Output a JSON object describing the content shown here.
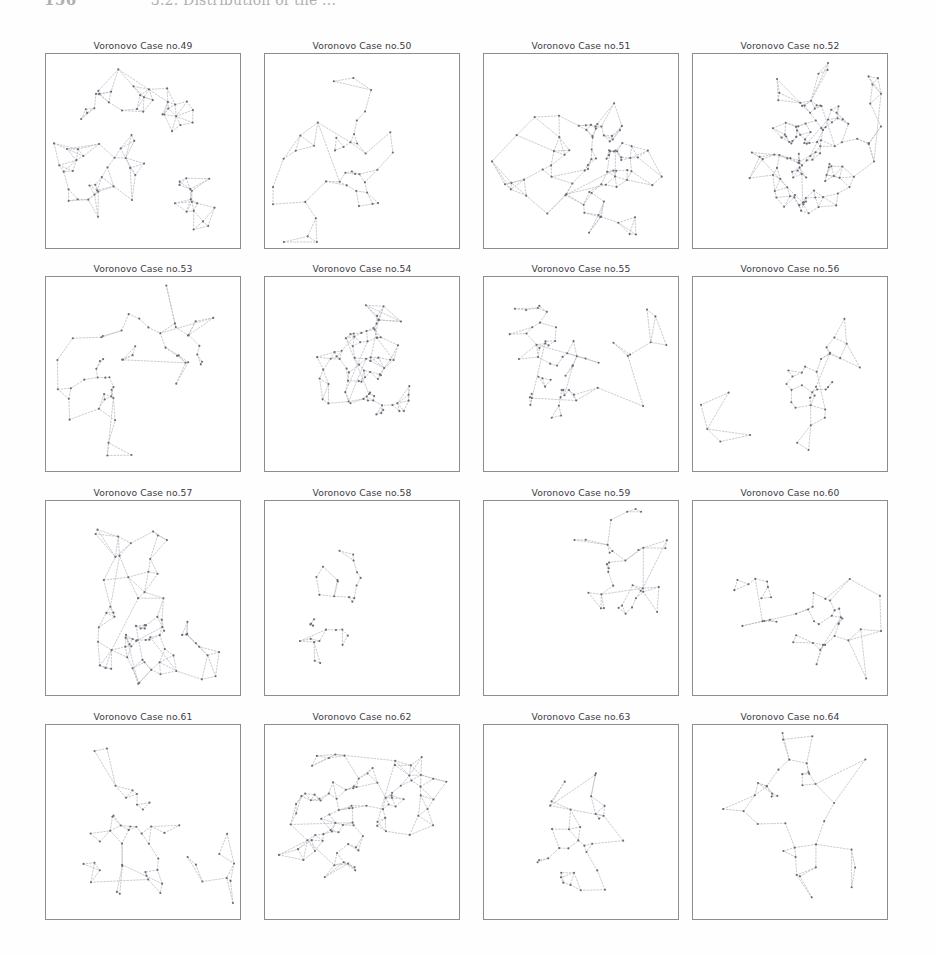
{
  "page": {
    "running_head_folio": "156",
    "running_head_title": "3.2. Distribution of the ...",
    "background_color": "#ffffff",
    "edge_color": "#b9b9c2",
    "node_color": "#6a6a74",
    "border_color": "#8c8c93"
  },
  "grid": {
    "columns": 4,
    "rows": 4,
    "panel_width": 196,
    "panel_height": 196,
    "col_x": [
      45,
      264,
      483,
      692
    ],
    "row_y": [
      40,
      263,
      487,
      711
    ]
  },
  "panels": [
    {
      "title": "Voronovo Case no.49",
      "case_number": 49,
      "node_count": 78,
      "density": "dense",
      "seed": 490
    },
    {
      "title": "Voronovo Case no.50",
      "case_number": 50,
      "node_count": 40,
      "density": "sparse",
      "seed": 503
    },
    {
      "title": "Voronovo Case no.51",
      "case_number": 51,
      "node_count": 82,
      "density": "dense",
      "seed": 517
    },
    {
      "title": "Voronovo Case no.52",
      "case_number": 52,
      "node_count": 120,
      "density": "very-dense",
      "seed": 529
    },
    {
      "title": "Voronovo Case no.53",
      "case_number": 53,
      "node_count": 52,
      "density": "medium",
      "seed": 531
    },
    {
      "title": "Voronovo Case no.54",
      "case_number": 54,
      "node_count": 74,
      "density": "dense",
      "seed": 547
    },
    {
      "title": "Voronovo Case no.55",
      "case_number": 55,
      "node_count": 56,
      "density": "medium",
      "seed": 553
    },
    {
      "title": "Voronovo Case no.56",
      "case_number": 56,
      "node_count": 38,
      "density": "sparse",
      "seed": 563
    },
    {
      "title": "Voronovo Case no.57",
      "case_number": 57,
      "node_count": 70,
      "density": "dense",
      "seed": 571
    },
    {
      "title": "Voronovo Case no.58",
      "case_number": 58,
      "node_count": 30,
      "density": "very-sparse",
      "seed": 587
    },
    {
      "title": "Voronovo Case no.59",
      "case_number": 59,
      "node_count": 34,
      "density": "sparse",
      "seed": 593
    },
    {
      "title": "Voronovo Case no.60",
      "case_number": 60,
      "node_count": 42,
      "density": "sparse",
      "seed": 601
    },
    {
      "title": "Voronovo Case no.61",
      "case_number": 61,
      "node_count": 48,
      "density": "medium",
      "seed": 613
    },
    {
      "title": "Voronovo Case no.62",
      "case_number": 62,
      "node_count": 88,
      "density": "dense",
      "seed": 627
    },
    {
      "title": "Voronovo Case no.63",
      "case_number": 63,
      "node_count": 32,
      "density": "sparse",
      "seed": 631
    },
    {
      "title": "Voronovo Case no.64",
      "case_number": 64,
      "node_count": 36,
      "density": "sparse",
      "seed": 643
    }
  ],
  "chart_data": {
    "type": "scatter",
    "xlabel": "",
    "ylabel": "",
    "grid": false,
    "legend": null,
    "series": [
      {
        "name": "Voronovo Case no.49",
        "nodes": 78,
        "edges": 104
      },
      {
        "name": "Voronovo Case no.50",
        "nodes": 40,
        "edges": 45
      },
      {
        "name": "Voronovo Case no.51",
        "nodes": 82,
        "edges": 110
      },
      {
        "name": "Voronovo Case no.52",
        "nodes": 120,
        "edges": 150
      },
      {
        "name": "Voronovo Case no.53",
        "nodes": 52,
        "edges": 58
      },
      {
        "name": "Voronovo Case no.54",
        "nodes": 74,
        "edges": 92
      },
      {
        "name": "Voronovo Case no.55",
        "nodes": 56,
        "edges": 68
      },
      {
        "name": "Voronovo Case no.56",
        "nodes": 38,
        "edges": 42
      },
      {
        "name": "Voronovo Case no.57",
        "nodes": 70,
        "edges": 95
      },
      {
        "name": "Voronovo Case no.58",
        "nodes": 30,
        "edges": 31
      },
      {
        "name": "Voronovo Case no.59",
        "nodes": 34,
        "edges": 38
      },
      {
        "name": "Voronovo Case no.60",
        "nodes": 42,
        "edges": 50
      },
      {
        "name": "Voronovo Case no.61",
        "nodes": 48,
        "edges": 60
      },
      {
        "name": "Voronovo Case no.62",
        "nodes": 88,
        "edges": 115
      },
      {
        "name": "Voronovo Case no.63",
        "nodes": 32,
        "edges": 38
      },
      {
        "name": "Voronovo Case no.64",
        "nodes": 36,
        "edges": 42
      }
    ]
  }
}
